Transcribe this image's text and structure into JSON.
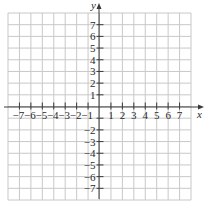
{
  "diagram": {
    "type": "cartesian-grid",
    "x_axis": {
      "label": "x",
      "min": -8,
      "max": 8,
      "tick_labels": [
        "-7",
        "-6",
        "-5",
        "-4",
        "-3",
        "-2",
        "-1",
        "1",
        "2",
        "3",
        "4",
        "5",
        "6",
        "7"
      ]
    },
    "y_axis": {
      "label": "y",
      "min": -8,
      "max": 8,
      "tick_labels": [
        "7",
        "6",
        "5",
        "4",
        "3",
        "2",
        "1",
        "-2",
        "-3",
        "-4",
        "-5",
        "-6",
        "-7"
      ]
    },
    "grid": {
      "columns": 16,
      "rows": 16
    },
    "colors": {
      "grid": "#c8c8c8",
      "axis": "#3a3a3a",
      "text": "#2a2a2a"
    }
  }
}
